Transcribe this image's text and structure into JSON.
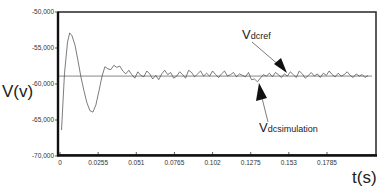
{
  "chart_data": {
    "type": "line",
    "title": "",
    "xlabel": "t(s)",
    "ylabel": "V(v)",
    "xlim": [
      0,
      0.21
    ],
    "ylim": [
      -70000,
      -50000
    ],
    "grid": false,
    "legend": null,
    "x_ticks": [
      0,
      0.0255,
      0.051,
      0.0765,
      0.102,
      0.1275,
      0.153,
      0.1785
    ],
    "x_tick_labels": [
      "0",
      "0.0255",
      "0.051",
      "0.0765",
      "0.102",
      "0.1275",
      "0.153",
      "0.1785"
    ],
    "y_ticks": [
      -50000,
      -55000,
      -60000,
      -65000,
      -70000
    ],
    "y_tick_labels": [
      "-50,000",
      "-55,000",
      "-60,000",
      "-65,000",
      "-70,000"
    ],
    "series": [
      {
        "name": "Vdcref",
        "style": "thin line",
        "color": "#555555",
        "x": [
          0,
          0.21
        ],
        "values": [
          -58900,
          -58900
        ]
      },
      {
        "name": "Vdcsimulation",
        "style": "thin line",
        "color": "#444444",
        "x": [
          0.001,
          0.003,
          0.005,
          0.0065,
          0.008,
          0.01,
          0.012,
          0.014,
          0.016,
          0.018,
          0.02,
          0.022,
          0.024,
          0.026,
          0.028,
          0.03,
          0.032,
          0.034,
          0.036,
          0.038,
          0.04,
          0.042,
          0.044,
          0.046,
          0.048,
          0.05,
          0.052,
          0.054,
          0.056,
          0.058,
          0.06,
          0.062,
          0.064,
          0.066,
          0.068,
          0.07,
          0.072,
          0.074,
          0.076,
          0.078,
          0.08,
          0.082,
          0.084,
          0.086,
          0.088,
          0.09,
          0.092,
          0.094,
          0.096,
          0.098,
          0.1,
          0.102,
          0.104,
          0.106,
          0.108,
          0.11,
          0.112,
          0.114,
          0.116,
          0.118,
          0.12,
          0.122,
          0.124,
          0.126,
          0.128,
          0.13,
          0.132,
          0.134,
          0.136,
          0.138,
          0.14,
          0.142,
          0.144,
          0.146,
          0.148,
          0.15,
          0.152,
          0.154,
          0.156,
          0.158,
          0.16,
          0.162,
          0.164,
          0.166,
          0.168,
          0.17,
          0.172,
          0.174,
          0.176,
          0.178,
          0.18,
          0.182,
          0.184,
          0.186,
          0.188,
          0.19,
          0.192,
          0.194,
          0.196,
          0.198,
          0.2,
          0.202,
          0.204,
          0.206
        ],
        "values": [
          -66400,
          -58500,
          -54200,
          -52900,
          -53300,
          -54600,
          -56700,
          -59000,
          -60900,
          -62600,
          -63700,
          -63900,
          -62900,
          -61000,
          -59000,
          -57600,
          -57900,
          -58000,
          -57400,
          -57700,
          -57500,
          -58200,
          -58600,
          -58100,
          -58700,
          -59200,
          -58300,
          -58800,
          -59000,
          -58200,
          -58600,
          -59300,
          -58800,
          -59400,
          -58600,
          -58100,
          -58700,
          -58400,
          -59200,
          -58900,
          -58300,
          -58700,
          -59200,
          -58100,
          -58400,
          -59000,
          -58600,
          -58200,
          -58900,
          -58500,
          -58900,
          -58200,
          -58700,
          -59100,
          -58600,
          -58200,
          -58900,
          -58700,
          -58400,
          -59000,
          -58600,
          -58800,
          -59000,
          -58400,
          -59400,
          -59300,
          -59700,
          -59200,
          -58700,
          -58900,
          -58500,
          -59000,
          -58400,
          -58700,
          -59100,
          -58600,
          -58900,
          -58300,
          -58700,
          -59100,
          -58200,
          -58600,
          -59200,
          -58800,
          -58400,
          -58900,
          -58600,
          -59100,
          -58500,
          -58800,
          -58200,
          -58700,
          -59000,
          -58500,
          -58900,
          -58700,
          -58300,
          -58800,
          -59100,
          -58600,
          -58900,
          -58700,
          -59100,
          -58800
        ],
        "transient": {
          "start_value": -66400,
          "peak": {
            "t": 0.0065,
            "value": -52900
          },
          "trough": {
            "t": 0.022,
            "value": -63900
          },
          "settles_near": -58900,
          "ripple_amplitude": 600
        }
      }
    ],
    "annotations": [
      {
        "text": "V",
        "subscript": "dcref",
        "full": "Vdcref",
        "arrow_to": {
          "t": 0.1,
          "value": -58900
        }
      },
      {
        "text": "V",
        "subscript": "dcsimulation",
        "full": "Vdcsimulation",
        "arrow_to": {
          "t": 0.1275,
          "value": -59700
        }
      }
    ]
  },
  "labels": {
    "y_axis": "V(v)",
    "x_axis": "t(s)",
    "ref_main": "V",
    "ref_sub": "dcref",
    "sim_main": "V",
    "sim_sub": "dcsimulation"
  }
}
